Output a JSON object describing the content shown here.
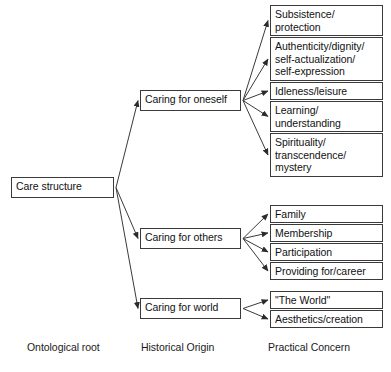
{
  "diagram": {
    "line_color": "#3a3a3a",
    "box_border_color": "#3a3a3a",
    "text_color": "#111111",
    "background": "#ffffff"
  },
  "root": {
    "label": "Care structure",
    "x": 11,
    "y": 177,
    "w": 103,
    "h": 21
  },
  "origins": [
    {
      "label": "Caring for oneself",
      "x": 140,
      "y": 90,
      "w": 101,
      "h": 21
    },
    {
      "label": "Caring for others",
      "x": 140,
      "y": 228,
      "w": 101,
      "h": 21
    },
    {
      "label": "Caring for world",
      "x": 140,
      "y": 298,
      "w": 101,
      "h": 21
    }
  ],
  "concerns": [
    {
      "label": "Subsistence/\nprotection",
      "x": 270,
      "y": 5,
      "w": 113,
      "h": 31,
      "parent": 0
    },
    {
      "label": "Authenticity/dignity/\nself-actualization/\nself-expression",
      "x": 270,
      "y": 37,
      "w": 113,
      "h": 44,
      "parent": 0
    },
    {
      "label": "Idleness/leisure",
      "x": 270,
      "y": 82,
      "w": 113,
      "h": 18,
      "parent": 0
    },
    {
      "label": "Learning/\nunderstanding",
      "x": 270,
      "y": 101,
      "w": 113,
      "h": 31,
      "parent": 0
    },
    {
      "label": "Spirituality/\ntranscendence/\nmystery",
      "x": 270,
      "y": 133,
      "w": 113,
      "h": 44,
      "parent": 0
    },
    {
      "label": "Family",
      "x": 270,
      "y": 205,
      "w": 113,
      "h": 18,
      "parent": 1
    },
    {
      "label": "Membership",
      "x": 270,
      "y": 224,
      "w": 113,
      "h": 18,
      "parent": 1
    },
    {
      "label": "Participation",
      "x": 270,
      "y": 243,
      "w": 113,
      "h": 18,
      "parent": 1
    },
    {
      "label": "Providing for/career",
      "x": 270,
      "y": 262,
      "w": 113,
      "h": 18,
      "parent": 1
    },
    {
      "label": "\"The World\"",
      "x": 270,
      "y": 291,
      "w": 113,
      "h": 18,
      "parent": 2
    },
    {
      "label": "Aesthetics/creation",
      "x": 270,
      "y": 310,
      "w": 113,
      "h": 18,
      "parent": 2
    }
  ],
  "column_labels": [
    {
      "label": "Ontological root",
      "x": 27,
      "y": 341
    },
    {
      "label": "Historical Origin",
      "x": 141,
      "y": 341
    },
    {
      "label": "Practical Concern",
      "x": 268,
      "y": 341
    }
  ]
}
